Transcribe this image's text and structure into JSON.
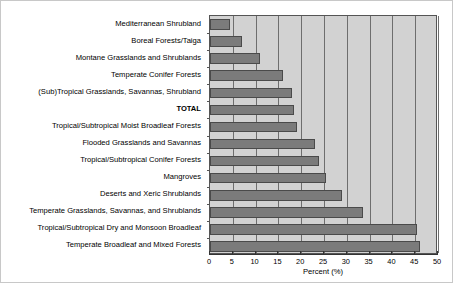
{
  "chart_data": {
    "type": "bar",
    "orientation": "horizontal",
    "title": "",
    "xlabel": "Percent (%)",
    "ylabel": "",
    "xlim": [
      0,
      50
    ],
    "xticks": [
      0,
      5,
      10,
      15,
      20,
      25,
      30,
      35,
      40,
      45,
      50
    ],
    "xtick_labels": [
      "0",
      "5",
      "10",
      "15",
      "20",
      "25",
      "30",
      "35",
      "40",
      "45",
      "50"
    ],
    "grid": true,
    "grid_axis": "x",
    "legend": false,
    "bar_color": "#7b7b7b",
    "plot_background": "#d2d2d2",
    "categories": [
      "Mediterranean Shrubland",
      "Boreal Forests/Taiga",
      "Montane Grasslands and Shrublands",
      "Temperate Conifer Forests",
      "(Sub)Tropical Grasslands, Savannas,  Shrubland",
      "TOTAL",
      "Tropical/Subtropical Moist Broadleaf Forests",
      "Flooded Grasslands and Savannas",
      "Tropical/Subtropical Conifer Forests",
      "Mangroves",
      "Deserts and Xeric Shrublands",
      "Temperate Grasslands, Savannas, and Shrublands",
      "Tropical/Subtropical Dry and Monsoon Broadleaf",
      "Temperate Broadleaf and Mixed Forests"
    ],
    "values": [
      4.4,
      7.0,
      11.0,
      16.0,
      18.0,
      18.5,
      19.0,
      23.0,
      24.0,
      25.5,
      29.0,
      33.5,
      45.5,
      46.0
    ],
    "emphasized_category": "TOTAL"
  }
}
